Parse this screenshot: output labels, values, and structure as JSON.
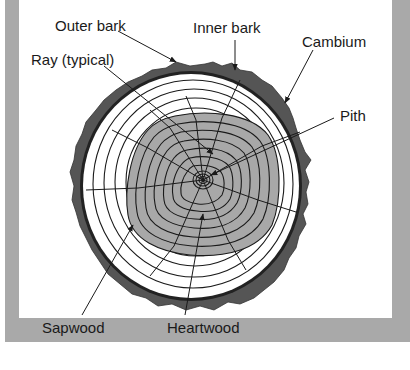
{
  "figure": {
    "colors": {
      "frame": "#a9a9a9",
      "bark": "#555555",
      "heartwood": "#a8a8a8",
      "sapwood": "#ffffff",
      "lines": "#1a1a1a"
    },
    "labels": {
      "outer_bark": "Outer bark",
      "inner_bark": "Inner bark",
      "cambium": "Cambium",
      "ray": "Ray (typical)",
      "pith": "Pith",
      "sapwood": "Sapwood",
      "heartwood": "Heartwood"
    }
  }
}
